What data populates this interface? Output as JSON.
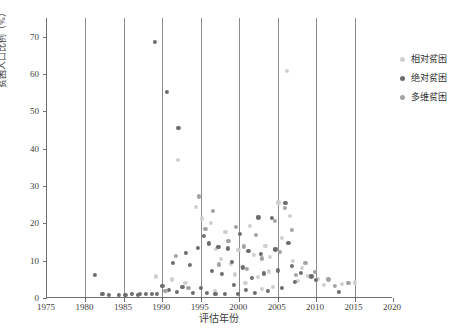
{
  "chart_data": {
    "type": "scatter",
    "title": "",
    "xlabel": "评估年份",
    "ylabel": "贫困人口比例（%）",
    "xlim": [
      1975,
      2020
    ],
    "ylim": [
      0,
      75
    ],
    "xticks": [
      1975,
      1980,
      1985,
      1990,
      1995,
      2000,
      2005,
      2010,
      2015,
      2020
    ],
    "yticks": [
      0,
      10,
      20,
      30,
      40,
      50,
      60,
      70
    ],
    "grid": "vertical-only",
    "legend_position": "right",
    "series": [
      {
        "name": "相对贫困",
        "color": "#cfcfcf",
        "points": [
          [
            1992.0,
            37.0
          ],
          [
            1994.4,
            24.5
          ],
          [
            1995.1,
            21.3
          ],
          [
            1996.3,
            20.1
          ],
          [
            1997.0,
            13.2
          ],
          [
            1997.6,
            10.4
          ],
          [
            1998.2,
            17.6
          ],
          [
            1998.9,
            9.2
          ],
          [
            1999.4,
            6.3
          ],
          [
            1999.9,
            12.8
          ],
          [
            2000.3,
            8.4
          ],
          [
            2000.8,
            4.1
          ],
          [
            2001.4,
            19.4
          ],
          [
            2001.9,
            11.5
          ],
          [
            2002.4,
            5.6
          ],
          [
            2002.9,
            2.4
          ],
          [
            2003.4,
            14.0
          ],
          [
            2003.9,
            7.1
          ],
          [
            2004.4,
            3.0
          ],
          [
            2005.1,
            25.6
          ],
          [
            2005.6,
            16.2
          ],
          [
            2006.2,
            60.8
          ],
          [
            2006.6,
            22.0
          ],
          [
            2007.0,
            10.0
          ],
          [
            2007.6,
            4.6
          ],
          [
            2008.2,
            8.0
          ],
          [
            2009.0,
            6.0
          ],
          [
            2010.2,
            5.2
          ],
          [
            2011.0,
            3.4
          ],
          [
            2013.4,
            3.8
          ],
          [
            2015.0,
            4.2
          ],
          [
            1989.2,
            5.8
          ],
          [
            1991.2,
            5.0
          ],
          [
            1993.0,
            4.0
          ],
          [
            1996.8,
            2.0
          ],
          [
            2004.0,
            11.0
          ]
        ]
      },
      {
        "name": "绝对贫困",
        "color": "#6d6d6d",
        "points": [
          [
            1981.2,
            6.2
          ],
          [
            1986.0,
            1.2
          ],
          [
            1987.1,
            1.1
          ],
          [
            1987.9,
            1.0
          ],
          [
            1988.6,
            1.0
          ],
          [
            1989.0,
            68.5
          ],
          [
            1989.3,
            1.0
          ],
          [
            1990.0,
            3.2
          ],
          [
            1990.6,
            55.2
          ],
          [
            1990.9,
            2.1
          ],
          [
            1991.4,
            9.4
          ],
          [
            1991.9,
            1.6
          ],
          [
            1992.1,
            45.6
          ],
          [
            1992.6,
            3.0
          ],
          [
            1993.1,
            12.1
          ],
          [
            1993.6,
            8.8
          ],
          [
            1994.0,
            1.4
          ],
          [
            1994.6,
            13.4
          ],
          [
            1995.0,
            2.6
          ],
          [
            1995.4,
            16.6
          ],
          [
            1995.8,
            1.3
          ],
          [
            1996.1,
            14.6
          ],
          [
            1996.5,
            7.2
          ],
          [
            1996.9,
            1.1
          ],
          [
            1997.3,
            13.6
          ],
          [
            1997.8,
            6.4
          ],
          [
            1998.1,
            1.2
          ],
          [
            1998.5,
            13.3
          ],
          [
            1999.0,
            9.6
          ],
          [
            1999.3,
            3.4
          ],
          [
            1999.8,
            1.0
          ],
          [
            2000.1,
            17.2
          ],
          [
            2000.5,
            8.2
          ],
          [
            2000.9,
            2.2
          ],
          [
            2001.2,
            12.6
          ],
          [
            2001.7,
            5.4
          ],
          [
            2002.0,
            1.4
          ],
          [
            2002.5,
            21.6
          ],
          [
            2002.8,
            11.8
          ],
          [
            2003.2,
            6.6
          ],
          [
            2003.7,
            2.0
          ],
          [
            2004.2,
            21.4
          ],
          [
            2004.7,
            13.0
          ],
          [
            2005.0,
            7.4
          ],
          [
            2005.5,
            2.8
          ],
          [
            2006.0,
            25.4
          ],
          [
            2006.4,
            14.8
          ],
          [
            2006.9,
            8.6
          ],
          [
            2007.2,
            4.4
          ],
          [
            2008.0,
            6.8
          ],
          [
            2009.4,
            5.8
          ],
          [
            2010.0,
            4.8
          ],
          [
            2013.0,
            1.6
          ],
          [
            1984.4,
            0.8
          ],
          [
            1985.2,
            0.9
          ],
          [
            1983.0,
            0.9
          ],
          [
            1982.2,
            1.0
          ],
          [
            1986.8,
            0.9
          ]
        ]
      },
      {
        "name": "多维贫困",
        "color": "#a3a3a3",
        "points": [
          [
            1994.8,
            27.2
          ],
          [
            1995.6,
            18.6
          ],
          [
            1996.6,
            23.4
          ],
          [
            1997.4,
            9.0
          ],
          [
            1998.6,
            15.2
          ],
          [
            1999.6,
            19.0
          ],
          [
            2000.6,
            13.8
          ],
          [
            2001.0,
            7.8
          ],
          [
            2002.2,
            16.8
          ],
          [
            2003.0,
            10.6
          ],
          [
            2004.6,
            20.6
          ],
          [
            2005.3,
            12.4
          ],
          [
            2006.8,
            18.2
          ],
          [
            2007.4,
            6.2
          ],
          [
            2008.6,
            9.4
          ],
          [
            2009.8,
            7.0
          ],
          [
            2011.6,
            5.0
          ],
          [
            2012.4,
            3.2
          ],
          [
            2014.2,
            4.0
          ],
          [
            1993.4,
            2.8
          ],
          [
            1991.8,
            11.2
          ],
          [
            1990.4,
            1.8
          ],
          [
            2005.9,
            24.2
          ]
        ]
      }
    ]
  }
}
